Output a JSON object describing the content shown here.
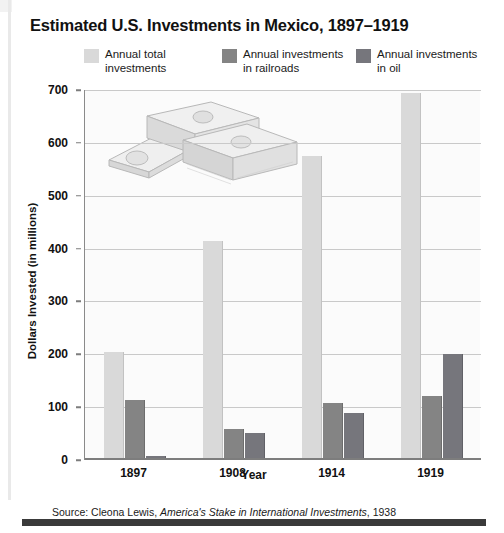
{
  "figure": {
    "title": "Estimated U.S. Investments in Mexico, 1897–1919",
    "source_prefix": "Source: Cleona Lewis, ",
    "source_title": "America's Stake in International Investments",
    "source_suffix": ", 1938"
  },
  "legend": {
    "items": [
      {
        "label": "Annual total\ninvestments",
        "color": "#d9d9d9",
        "name": "annual-total-investments"
      },
      {
        "label": "Annual investments\nin railroads",
        "color": "#848484",
        "name": "annual-investments-railroads"
      },
      {
        "label": "Annual investments\nin oil",
        "color": "#76767c",
        "name": "annual-investments-oil"
      }
    ]
  },
  "axes": {
    "y_ticks": [
      "700",
      "600",
      "500",
      "400",
      "300",
      "200",
      "100",
      "0"
    ],
    "x_ticks": [
      "1897",
      "1908",
      "1914",
      "1919"
    ],
    "ylabel": "Dollars Invested (in millions)",
    "xlabel": "Year"
  },
  "chart_data": {
    "type": "bar",
    "title": "Estimated U.S. Investments in Mexico, 1897–1919",
    "xlabel": "Year",
    "ylabel": "Dollars Invested (in millions)",
    "categories": [
      "1897",
      "1908",
      "1914",
      "1919"
    ],
    "ylim": [
      0,
      700
    ],
    "ytick_step": 100,
    "grid": true,
    "legend_position": "top",
    "units": "millions of U.S. dollars",
    "series": [
      {
        "name": "Annual total investments",
        "color": "#d9d9d9",
        "values": [
          200,
          410,
          572,
          690
        ]
      },
      {
        "name": "Annual investments in railroads",
        "color": "#848484",
        "values": [
          110,
          55,
          105,
          118
        ]
      },
      {
        "name": "Annual investments in oil",
        "color": "#76767c",
        "values": [
          3,
          48,
          85,
          197
        ]
      }
    ]
  }
}
